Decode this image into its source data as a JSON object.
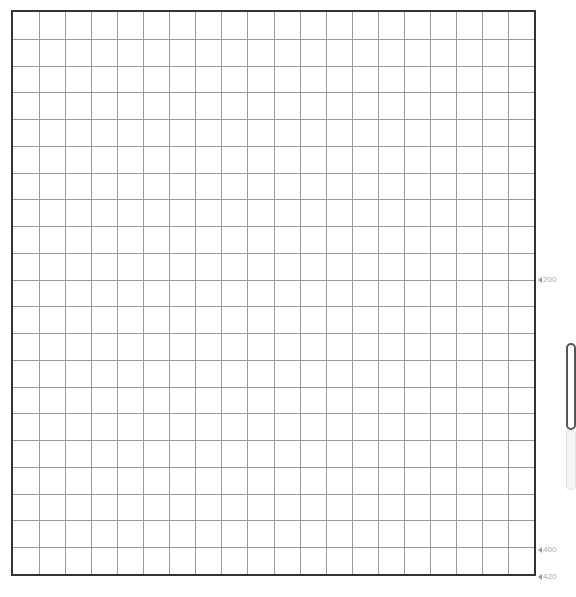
{
  "grid": {
    "columns": 20,
    "rows": 21,
    "line_color": "#9a9a9a",
    "border_color": "#333333"
  },
  "ruler": {
    "markers": [
      {
        "label": "200",
        "y": 274
      },
      {
        "label": "400",
        "y": 544
      },
      {
        "label": "420",
        "y": 571
      }
    ],
    "marker_color": "#aaaaaa"
  },
  "side_panel": {
    "tab_active": "",
    "tab_inactive": ""
  }
}
